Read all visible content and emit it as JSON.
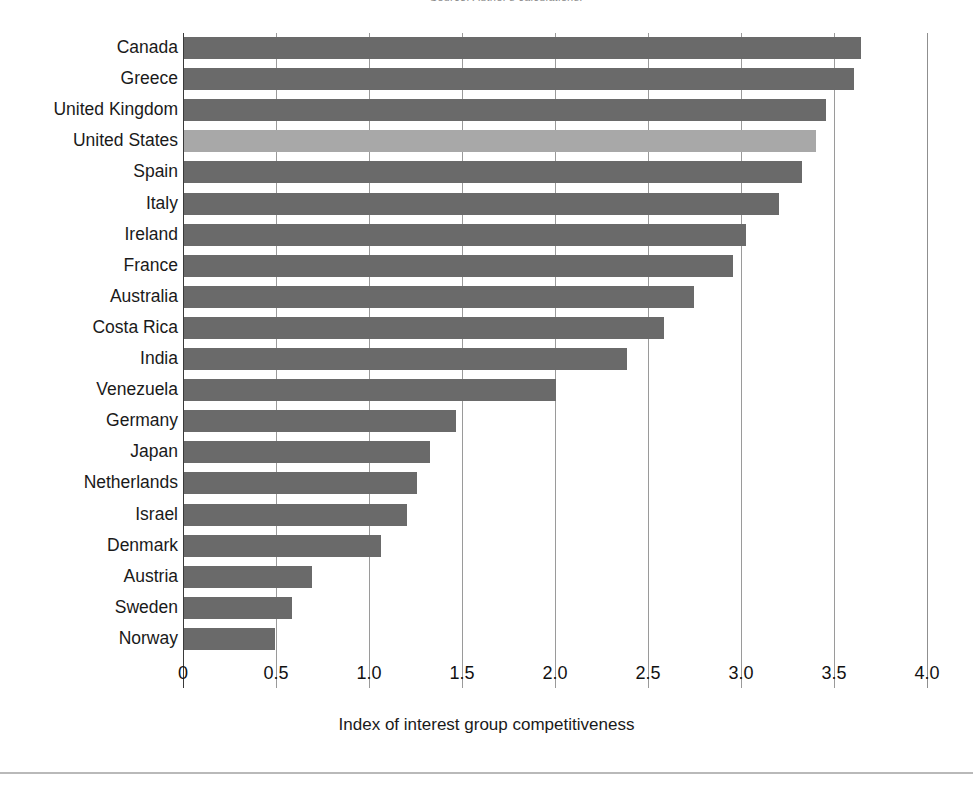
{
  "page": {
    "top_cut_text": "Source: Author's calculations.",
    "background_color": "#ffffff"
  },
  "chart_data": {
    "type": "bar",
    "orientation": "horizontal",
    "title": "",
    "subtitle": "",
    "xlabel": "Index of interest group competitiveness",
    "ylabel": "",
    "xlim": [
      0,
      4.0
    ],
    "xticks": [
      "0",
      "0.5",
      "1.0",
      "1.5",
      "2.0",
      "2.5",
      "3.0",
      "3.5",
      "4.0"
    ],
    "xtick_values": [
      0,
      0.5,
      1.0,
      1.5,
      2.0,
      2.5,
      3.0,
      3.5,
      4.0
    ],
    "grid": "vertical",
    "legend": "none",
    "bar_color": "#6a6a6a",
    "highlight_color": "#a8a8a8",
    "highlight_category": "United States",
    "categories": [
      "Canada",
      "Greece",
      "United Kingdom",
      "United States",
      "Spain",
      "Italy",
      "Ireland",
      "France",
      "Australia",
      "Costa Rica",
      "India",
      "Venezuela",
      "Germany",
      "Japan",
      "Netherlands",
      "Israel",
      "Denmark",
      "Austria",
      "Sweden",
      "Norway"
    ],
    "values": [
      3.64,
      3.6,
      3.45,
      3.4,
      3.32,
      3.2,
      3.02,
      2.95,
      2.74,
      2.58,
      2.38,
      2.0,
      1.46,
      1.32,
      1.25,
      1.2,
      1.06,
      0.69,
      0.58,
      0.49
    ],
    "highlighted": [
      false,
      false,
      false,
      true,
      false,
      false,
      false,
      false,
      false,
      false,
      false,
      false,
      false,
      false,
      false,
      false,
      false,
      false,
      false,
      false
    ]
  }
}
